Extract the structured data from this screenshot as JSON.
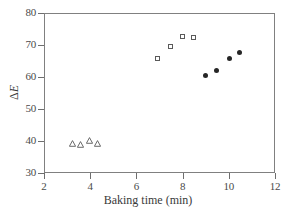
{
  "chart_data": {
    "type": "scatter",
    "title": "",
    "xlabel": "Baking time (min)",
    "ylabel": "ΔE",
    "xlim": [
      2,
      12
    ],
    "ylim": [
      30,
      80
    ],
    "xticks": [
      2,
      4,
      6,
      8,
      10,
      12
    ],
    "yticks": [
      30,
      40,
      50,
      60,
      70,
      80
    ],
    "grid": false,
    "legend": "none",
    "series": [
      {
        "name": "open-triangles",
        "marker": "triangle-open",
        "color": "#5a5a5a",
        "points": [
          {
            "x": 3.25,
            "y": 41.4
          },
          {
            "x": 3.6,
            "y": 41.0
          },
          {
            "x": 3.95,
            "y": 42.3
          },
          {
            "x": 4.3,
            "y": 41.4
          }
        ]
      },
      {
        "name": "open-squares",
        "marker": "square-open",
        "color": "#5a5a5a",
        "points": [
          {
            "x": 6.95,
            "y": 65.7
          },
          {
            "x": 7.5,
            "y": 69.4
          },
          {
            "x": 8.0,
            "y": 72.6
          },
          {
            "x": 8.5,
            "y": 72.2
          }
        ]
      },
      {
        "name": "filled-circles",
        "marker": "circle-filled",
        "color": "#262626",
        "points": [
          {
            "x": 9.0,
            "y": 60.3
          },
          {
            "x": 9.5,
            "y": 61.8
          },
          {
            "x": 10.05,
            "y": 65.7
          },
          {
            "x": 10.5,
            "y": 67.4
          }
        ]
      }
    ]
  },
  "axes": {
    "x_tick_labels": [
      "2",
      "4",
      "6",
      "8",
      "10",
      "12"
    ],
    "y_tick_labels": [
      "30",
      "40",
      "50",
      "60",
      "70",
      "80"
    ],
    "x_title": "Baking time (min)",
    "y_title_delta": "Δ",
    "y_title_e": "E"
  },
  "colors": {
    "frame": "#808080",
    "tick": "#6e6e6e",
    "text": "#3a3a3a",
    "marker_open": "#5a5a5a",
    "marker_filled": "#262626",
    "background": "#ffffff"
  }
}
